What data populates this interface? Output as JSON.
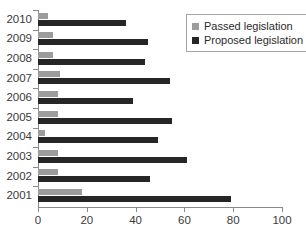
{
  "chart_data": {
    "type": "bar",
    "orientation": "horizontal",
    "title": "",
    "xlabel": "",
    "ylabel": "",
    "xlim": [
      0,
      100
    ],
    "xticks": [
      0,
      20,
      40,
      60,
      80,
      100
    ],
    "grid": false,
    "legend_position": "top-right",
    "categories": [
      "2010",
      "2009",
      "2008",
      "2007",
      "2006",
      "2005",
      "2004",
      "2003",
      "2002",
      "2001"
    ],
    "series": [
      {
        "name": "Passed legislation",
        "color": "#9c9c9c",
        "values": [
          4,
          6,
          6,
          9,
          8,
          8,
          3,
          8,
          8,
          18
        ]
      },
      {
        "name": "Proposed legislation",
        "color": "#262626",
        "values": [
          36,
          45,
          44,
          54,
          39,
          55,
          49,
          61,
          46,
          79
        ]
      }
    ]
  },
  "legend": {
    "items": [
      {
        "label": "Passed legislation",
        "color": "#9c9c9c"
      },
      {
        "label": "Proposed legislation",
        "color": "#262626"
      }
    ]
  },
  "axis": {
    "x_tick_labels": [
      "0",
      "20",
      "40",
      "60",
      "80",
      "100"
    ],
    "y_tick_labels": [
      "2010",
      "2009",
      "2008",
      "2007",
      "2006",
      "2005",
      "2004",
      "2003",
      "2002",
      "2001"
    ]
  }
}
